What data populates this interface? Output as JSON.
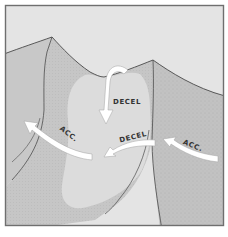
{
  "diagram": {
    "type": "terrain-airflow-illustration",
    "colors": {
      "background": "#ffffff",
      "frame": "#6f6f6f",
      "sky": "#e4e4e4",
      "slope": "#c9c9c9",
      "slope_shaded": "#bcbcbc",
      "valley": "#dcdcdc",
      "ridge_line": "#4a4a4a",
      "arrow": "#ffffff",
      "arrow_outline": "#9a9a9a",
      "label": "#333333"
    },
    "labels": {
      "decel_top": "DECEL",
      "decel_mid": "DECEL",
      "acc_left": "ACC.",
      "acc_right": "ACC."
    },
    "arrows": [
      {
        "id": "descending-arrow",
        "direction": "down",
        "label_ref": "decel_top"
      },
      {
        "id": "mid-arrow",
        "direction": "left",
        "label_ref": "decel_mid"
      },
      {
        "id": "left-arrow",
        "direction": "up-left",
        "label_ref": "acc_left"
      },
      {
        "id": "right-arrow",
        "direction": "left",
        "label_ref": "acc_right"
      }
    ]
  }
}
